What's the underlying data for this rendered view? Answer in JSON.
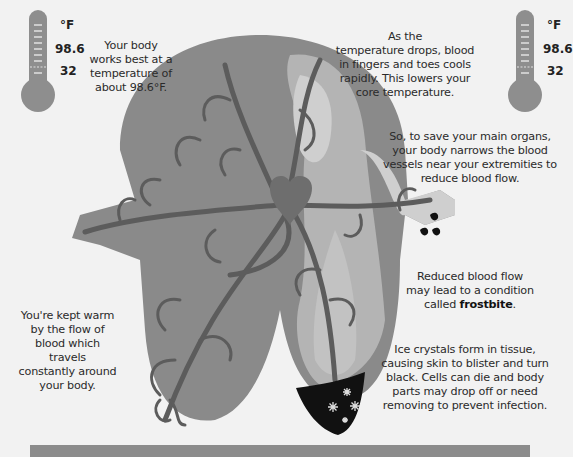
{
  "thermometer_left": {
    "unit": "°F",
    "values": [
      "98.6",
      "32"
    ]
  },
  "thermometer_right": {
    "unit": "°F",
    "values": [
      "98.6",
      "32"
    ]
  },
  "annotations": {
    "body_temp": [
      "Your body",
      "works best at a",
      "temperature of",
      "about 98.6°F."
    ],
    "temp_drop": [
      "As the",
      "temperature drops, blood",
      "in fingers and toes cools",
      "rapidly. This lowers your",
      "core temperature."
    ],
    "save_organs": [
      "So, to save your main organs,",
      "your body narrows the blood",
      "vessels near your extremities to",
      "reduce blood flow."
    ],
    "reduced_flow": {
      "lines": [
        "Reduced blood flow",
        "may lead to a condition"
      ],
      "prefix": "called ",
      "term": "frostbite",
      "suffix": "."
    },
    "kept_warm": [
      "You're kept warm",
      "by the flow of",
      "blood which travels",
      "constantly around",
      "your body."
    ],
    "ice_crystals": [
      "Ice crystals form in tissue,",
      "causing skin to blister and turn",
      "black. Cells can die and body",
      "parts may drop off or need",
      "removing to prevent infection."
    ]
  },
  "colors": {
    "background": "#f2f2f2",
    "body_dark": "#8a8a8a",
    "body_light": "#b4b4b4",
    "body_lighter": "#cfcfcf",
    "vessel": "#5c5c5c",
    "heart": "#6e6e6e",
    "frostbite": "#111111",
    "thermometer": "#8e8e8e"
  },
  "icons": {
    "thermometer": "thermometer-icon",
    "heart": "heart-icon",
    "snowflake": "snowflake-icon"
  }
}
